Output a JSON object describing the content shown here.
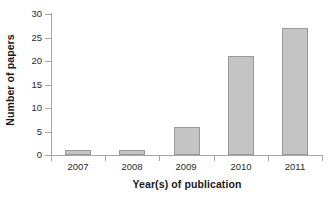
{
  "chart_data": {
    "type": "bar",
    "title": "",
    "subtitle": "",
    "xlabel": "Year(s) of publication",
    "ylabel": "Number of papers",
    "categories": [
      "2007",
      "2008",
      "2009",
      "2010",
      "2011"
    ],
    "values": [
      1,
      1,
      6,
      21,
      27
    ],
    "series": [
      {
        "name": "Number of papers",
        "values": [
          1,
          1,
          6,
          21,
          27
        ]
      }
    ],
    "ylim": [
      0,
      30
    ],
    "y_ticks": [
      0,
      5,
      10,
      15,
      20,
      25,
      30
    ],
    "y_tick_labels": [
      "0",
      "5",
      "10",
      "15",
      "20",
      "25",
      "30"
    ],
    "x_tick_labels": [
      "2007",
      "2008",
      "2009",
      "2010",
      "2011"
    ],
    "grid": false,
    "legend": false,
    "legend_position": "none",
    "annotations": [],
    "colors": {
      "bar_fill": "#c4c4c4",
      "bar_border": "#9a9a9a",
      "axis": "#a6a6a6",
      "text": "#1a1a1a",
      "tick_text": "#2b2b2b",
      "background": "#ffffff"
    }
  }
}
